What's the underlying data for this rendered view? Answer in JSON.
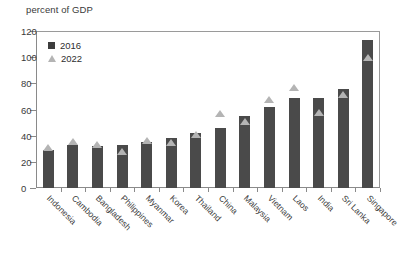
{
  "chart_data": {
    "type": "bar",
    "title": "percent of GDP",
    "xlabel": "",
    "ylabel": "percent of GDP",
    "ylim": [
      0,
      120
    ],
    "yticks": [
      0,
      20,
      40,
      60,
      80,
      100,
      120
    ],
    "grid": false,
    "legend_position": "top-left",
    "categories": [
      "Indonesia",
      "Cambodia",
      "Bangladesh",
      "Philippines",
      "Myanmar",
      "Korea",
      "Thailand",
      "China",
      "Malaysia",
      "Vietnam",
      "Laos",
      "India",
      "Sri Lanka",
      "Singapore"
    ],
    "series": [
      {
        "name": "2016",
        "marker": "bar",
        "color": "#4a4a4a",
        "values": [
          29,
          33,
          32,
          33,
          35,
          38,
          42,
          46,
          55,
          62,
          69,
          69,
          76,
          113
        ]
      },
      {
        "name": "2022",
        "marker": "triangle",
        "color": "#b4b4b4",
        "values": [
          31,
          36,
          34,
          28,
          37,
          35,
          41,
          57,
          51,
          68,
          77,
          58,
          72,
          100
        ]
      }
    ]
  },
  "legend": {
    "items": [
      {
        "label": "2016",
        "marker": "square"
      },
      {
        "label": "2022",
        "marker": "triangle"
      }
    ]
  }
}
